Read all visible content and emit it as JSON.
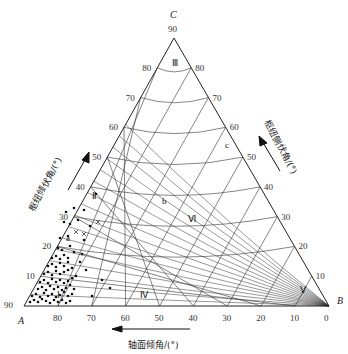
{
  "figure": {
    "vertices": {
      "A": {
        "label": "A",
        "x": 24,
        "y": 306
      },
      "B": {
        "label": "B",
        "x": 329,
        "y": 306
      },
      "C": {
        "label": "C",
        "x": 174,
        "y": 38
      }
    },
    "axes": {
      "bottom": {
        "label": "轴面倾角/(°)",
        "ticks": [
          "90",
          "80",
          "70",
          "60",
          "50",
          "40",
          "30",
          "20",
          "10",
          "0"
        ],
        "arrow_direction": "left"
      },
      "left": {
        "label": "枢纽倾伏角/(°)",
        "ticks": [
          "10",
          "20",
          "30",
          "40",
          "50",
          "60",
          "70",
          "80"
        ],
        "apex_tick": "90",
        "arrow_direction": "up"
      },
      "right": {
        "label": "枢纽侧伏角/(°)",
        "ticks": [
          "10",
          "20",
          "30",
          "40",
          "50",
          "60",
          "70",
          "80"
        ],
        "arrow_direction": "up"
      }
    },
    "regions": [
      {
        "label": "Ⅰ",
        "x": 57,
        "y": 298
      },
      {
        "label": "Ⅱ",
        "x": 92,
        "y": 199
      },
      {
        "label": "Ⅲ",
        "x": 172,
        "y": 66
      },
      {
        "label": "Ⅳ",
        "x": 140,
        "y": 298
      },
      {
        "label": "Ⅴ",
        "x": 300,
        "y": 293
      },
      {
        "label": "Ⅵ",
        "x": 188,
        "y": 222
      },
      {
        "label": "a",
        "x": 66,
        "y": 241
      },
      {
        "label": "b",
        "x": 162,
        "y": 204
      },
      {
        "label": "c",
        "x": 225,
        "y": 148
      }
    ]
  },
  "chart_data": {
    "type": "scatter",
    "subtype": "ternary",
    "title": "",
    "axes": [
      "轴面倾角/(°)",
      "枢纽倾伏角/(°)",
      "枢纽侧伏角/(°)"
    ],
    "vertices": [
      "A",
      "B",
      "C"
    ],
    "tick_range": [
      0,
      90
    ],
    "tick_step": 10,
    "regions": [
      "Ⅰ",
      "Ⅱ",
      "Ⅲ",
      "Ⅳ",
      "Ⅴ",
      "Ⅵ",
      "a",
      "b",
      "c"
    ],
    "points_description": "Dense cluster of dots in region Ⅰ near vertex A (axial-plane dip 75–90°, plunge 0–30°); a few 'x' marks near plunge 15–25°",
    "points": [
      [
        30,
        302
      ],
      [
        34,
        300
      ],
      [
        38,
        302
      ],
      [
        42,
        299
      ],
      [
        46,
        301
      ],
      [
        50,
        303
      ],
      [
        54,
        300
      ],
      [
        58,
        302
      ],
      [
        62,
        300
      ],
      [
        66,
        303
      ],
      [
        70,
        301
      ],
      [
        32,
        296
      ],
      [
        36,
        294
      ],
      [
        40,
        297
      ],
      [
        44,
        293
      ],
      [
        48,
        296
      ],
      [
        52,
        294
      ],
      [
        56,
        297
      ],
      [
        60,
        295
      ],
      [
        64,
        292
      ],
      [
        68,
        296
      ],
      [
        72,
        294
      ],
      [
        38,
        289
      ],
      [
        42,
        287
      ],
      [
        46,
        290
      ],
      [
        50,
        286
      ],
      [
        54,
        289
      ],
      [
        58,
        287
      ],
      [
        62,
        290
      ],
      [
        66,
        288
      ],
      [
        70,
        285
      ],
      [
        74,
        289
      ],
      [
        40,
        282
      ],
      [
        44,
        280
      ],
      [
        48,
        283
      ],
      [
        52,
        279
      ],
      [
        56,
        282
      ],
      [
        60,
        280
      ],
      [
        64,
        283
      ],
      [
        68,
        281
      ],
      [
        72,
        278
      ],
      [
        44,
        274
      ],
      [
        48,
        272
      ],
      [
        52,
        275
      ],
      [
        56,
        271
      ],
      [
        60,
        274
      ],
      [
        64,
        272
      ],
      [
        68,
        270
      ],
      [
        76,
        276
      ],
      [
        48,
        266
      ],
      [
        52,
        264
      ],
      [
        56,
        267
      ],
      [
        60,
        263
      ],
      [
        64,
        266
      ],
      [
        68,
        262
      ],
      [
        72,
        268
      ],
      [
        52,
        258
      ],
      [
        56,
        256
      ],
      [
        60,
        259
      ],
      [
        64,
        255
      ],
      [
        68,
        258
      ],
      [
        80,
        262
      ],
      [
        86,
        270
      ],
      [
        58,
        248
      ],
      [
        62,
        250
      ],
      [
        70,
        246
      ],
      [
        74,
        252
      ],
      [
        82,
        254
      ],
      [
        60,
        238
      ],
      [
        68,
        236
      ],
      [
        84,
        240
      ],
      [
        64,
        222
      ],
      [
        70,
        224
      ],
      [
        78,
        220
      ],
      [
        90,
        226
      ],
      [
        66,
        212
      ],
      [
        74,
        208
      ],
      [
        84,
        210
      ],
      [
        96,
        194
      ],
      [
        102,
        280
      ],
      [
        110,
        288
      ],
      [
        92,
        296
      ]
    ],
    "x_marks": [
      [
        84,
        234
      ],
      [
        98,
        222
      ],
      [
        76,
        232
      ]
    ]
  }
}
